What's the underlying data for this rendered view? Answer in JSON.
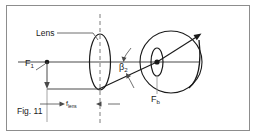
{
  "figure": {
    "caption": "Fig. 11",
    "type": "optical ray diagram",
    "background_color": "#ffffff",
    "border_color": "#8d8d8d",
    "line_color": "#1a1a1a",
    "dashed_color": "#6e6e6e"
  },
  "labels": {
    "lens": "Lens",
    "front_focal_point": "F",
    "front_focal_point_sub": "1",
    "angle": "β",
    "angle_sub": "2",
    "eye_focal_point": "F",
    "eye_focal_point_sub": "b",
    "focal_length": "f",
    "focal_length_sub": "lens"
  },
  "elements": {
    "optical_axis": "horizontal-axis-line",
    "lens_shape": "biconvex-lens-ellipse",
    "lens_centerline": "vertical-dashed-line",
    "eyeball": "circle",
    "eye_lens": "small-ellipse",
    "object_arrow": "downward-arrow",
    "ray": "slanted-ray-line",
    "retina_arrowhead": "arrowhead-up-right",
    "retina_curved_arrow": "curved-arrow",
    "dimension_line": "focal-length-dimension",
    "leader_line_lens": "leader-line",
    "leader_line_f1": "leader-line",
    "angle_arrow_upper": "curved-angle-arrow",
    "angle_arrow_lower": "curved-angle-arrow",
    "focal_point_dot_left": "dot",
    "focal_point_dot_eye": "dot"
  }
}
